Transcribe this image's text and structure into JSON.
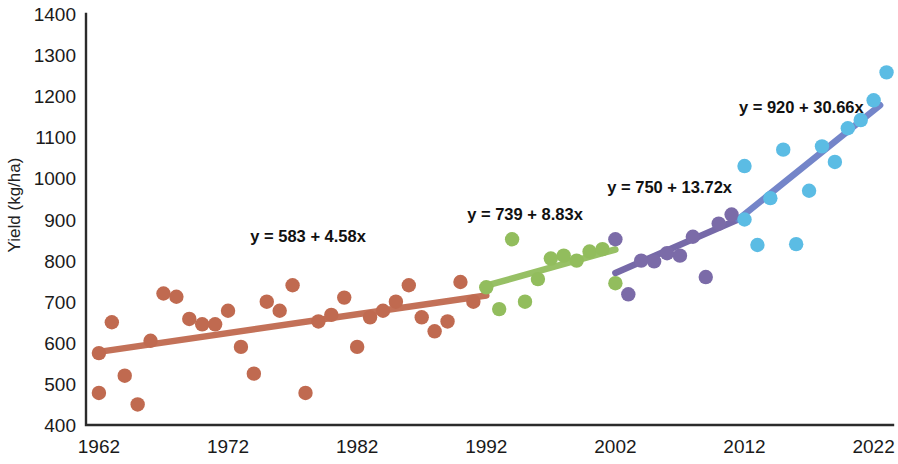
{
  "chart_data": {
    "type": "scatter",
    "title": "",
    "xlabel": "",
    "ylabel": "Yield (kg/ha)",
    "xlim": [
      1961,
      2023.5
    ],
    "ylim": [
      400,
      1400
    ],
    "ytick_step": 100,
    "xtick_step": 10,
    "grid": false,
    "legend": null,
    "xticks": [
      "1962",
      "1972",
      "1982",
      "1992",
      "2002",
      "2012",
      "2022"
    ],
    "xtick_values": [
      1962,
      1972,
      1982,
      1992,
      2002,
      2012,
      2022
    ],
    "yticks": [
      "400",
      "500",
      "600",
      "700",
      "800",
      "900",
      "1000",
      "1100",
      "1200",
      "1300",
      "1400"
    ],
    "ytick_values": [
      400,
      500,
      600,
      700,
      800,
      900,
      1000,
      1100,
      1200,
      1300,
      1400
    ],
    "colors": {
      "period1": "#c06a50",
      "period2": "#92bd5d",
      "period3": "#7b6ba8",
      "period4": "#5bbce4",
      "trend1": "#c06a50",
      "trend2": "#92bd5d",
      "trend3": "#6f62a4",
      "trend4": "#6d7fc7",
      "axis": "#2b2b2b",
      "text": "#111111"
    },
    "series": [
      {
        "name": "period1",
        "color": "#c06a50",
        "x": [
          1962,
          1962,
          1963,
          1964,
          1965,
          1966,
          1967,
          1968,
          1969,
          1970,
          1971,
          1972,
          1973,
          1974,
          1975,
          1976,
          1977,
          1978,
          1979,
          1980,
          1981,
          1982,
          1983,
          1984,
          1985,
          1986,
          1987,
          1988,
          1989,
          1990,
          1991
        ],
        "y": [
          575,
          478,
          650,
          520,
          450,
          605,
          720,
          712,
          658,
          645,
          645,
          678,
          590,
          525,
          700,
          678,
          740,
          478,
          652,
          668,
          710,
          590,
          662,
          678,
          700,
          740,
          662,
          628,
          652,
          748,
          700
        ],
        "trend": {
          "equation": "y = 583 + 4.58x",
          "intercept": 583,
          "slope": 4.58,
          "x_start": 1962,
          "x_end": 1992,
          "y_start": 578,
          "y_end": 715
        }
      },
      {
        "name": "period2",
        "color": "#92bd5d",
        "x": [
          1992,
          1993,
          1994,
          1995,
          1996,
          1997,
          1998,
          1999,
          2000,
          2001,
          2002
        ],
        "y": [
          735,
          682,
          852,
          700,
          755,
          805,
          812,
          800,
          822,
          828,
          745
        ],
        "trend": {
          "equation": "y = 739 + 8.83x",
          "intercept": 739,
          "slope": 8.83,
          "x_start": 1992,
          "x_end": 2002,
          "y_start": 739,
          "y_end": 827
        }
      },
      {
        "name": "period3",
        "color": "#7b6ba8",
        "x": [
          2002,
          2003,
          2004,
          2005,
          2006,
          2007,
          2008,
          2009,
          2010,
          2011
        ],
        "y": [
          852,
          718,
          800,
          798,
          818,
          812,
          858,
          760,
          890,
          912
        ],
        "trend": {
          "equation": "y = 750 + 13.72x",
          "intercept": 750,
          "slope": 13.72,
          "x_start": 2002,
          "x_end": 2011.5,
          "y_start": 770,
          "y_end": 900
        }
      },
      {
        "name": "period4",
        "color": "#5bbce4",
        "x": [
          2012,
          2012,
          2013,
          2014,
          2015,
          2016,
          2017,
          2018,
          2019,
          2020,
          2021,
          2022,
          2023
        ],
        "y": [
          1030,
          900,
          838,
          952,
          1070,
          840,
          970,
          1078,
          1040,
          1122,
          1142,
          1190,
          1258
        ],
        "trend": {
          "equation": "y = 920 + 30.66x",
          "intercept": 920,
          "slope": 30.66,
          "x_start": 2011.5,
          "x_end": 2022.5,
          "y_start": 900,
          "y_end": 1178
        }
      }
    ],
    "annotations": [
      {
        "text": "y = 583 + 4.58x",
        "x": 1978.2,
        "y": 845
      },
      {
        "text": "y = 739 + 8.83x",
        "x": 1995.0,
        "y": 900
      },
      {
        "text": "y = 750 + 13.72x",
        "x": 2006.2,
        "y": 965
      },
      {
        "text": "y = 920 + 30.66x",
        "x": 2016.4,
        "y": 1160
      }
    ]
  }
}
